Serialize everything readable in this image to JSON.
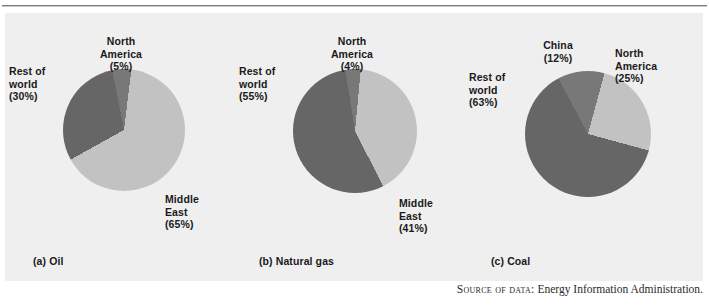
{
  "figure": {
    "top_rule": true,
    "panel_background": "#efefef",
    "source_prefix": "Source of data:",
    "source_text": "Energy Information Administration."
  },
  "palette": {
    "light_gray": "#c2c2c2",
    "mid_gray": "#787878",
    "dark_gray": "#666666",
    "text": "#1a1a1a"
  },
  "chart_data": [
    {
      "type": "pie",
      "id": "oil",
      "title": "(a) Oil",
      "caption": "(a) Oil",
      "legend_position": "callout-labels",
      "slices": [
        {
          "label": "North America",
          "value": 5,
          "pct_text": "(5%)",
          "color": "#787878"
        },
        {
          "label": "Middle East",
          "value": 65,
          "pct_text": "(65%)",
          "color": "#c2c2c2"
        },
        {
          "label": "Rest of world",
          "value": 30,
          "pct_text": "(30%)",
          "color": "#666666"
        }
      ],
      "labels": {
        "north_america": {
          "line1": "North",
          "line2": "America",
          "pct": "(5%)"
        },
        "rest_of_world": {
          "line1": "Rest of",
          "line2": "world",
          "pct": "(30%)"
        },
        "middle_east": {
          "line1": "Middle",
          "line2": "East",
          "pct": "(65%)"
        }
      }
    },
    {
      "type": "pie",
      "id": "natural-gas",
      "title": "(b) Natural gas",
      "caption": "(b) Natural gas",
      "legend_position": "callout-labels",
      "slices": [
        {
          "label": "North America",
          "value": 4,
          "pct_text": "(4%)",
          "color": "#787878"
        },
        {
          "label": "Middle East",
          "value": 41,
          "pct_text": "(41%)",
          "color": "#c2c2c2"
        },
        {
          "label": "Rest of world",
          "value": 55,
          "pct_text": "(55%)",
          "color": "#666666"
        }
      ],
      "labels": {
        "north_america": {
          "line1": "North",
          "line2": "America",
          "pct": "(4%)"
        },
        "rest_of_world": {
          "line1": "Rest of",
          "line2": "world",
          "pct": "(55%)"
        },
        "middle_east": {
          "line1": "Middle",
          "line2": "East",
          "pct": "(41%)"
        }
      }
    },
    {
      "type": "pie",
      "id": "coal",
      "title": "(c) Coal",
      "caption": "(c) Coal",
      "legend_position": "callout-labels",
      "slices": [
        {
          "label": "China",
          "value": 12,
          "pct_text": "(12%)",
          "color": "#787878"
        },
        {
          "label": "North America",
          "value": 25,
          "pct_text": "(25%)",
          "color": "#c2c2c2"
        },
        {
          "label": "Rest of world",
          "value": 63,
          "pct_text": "(63%)",
          "color": "#666666"
        }
      ],
      "labels": {
        "china": {
          "line1": "China",
          "line2": "",
          "pct": "(12%)"
        },
        "north_america": {
          "line1": "North",
          "line2": "America",
          "pct": "(25%)"
        },
        "rest_of_world": {
          "line1": "Rest of",
          "line2": "world",
          "pct": "(63%)"
        }
      }
    }
  ]
}
